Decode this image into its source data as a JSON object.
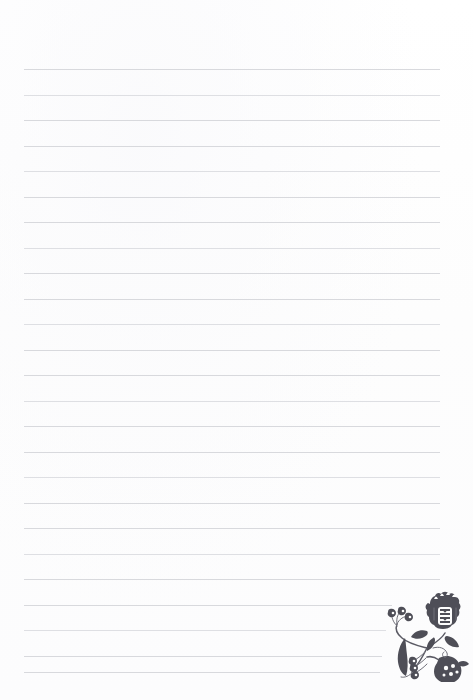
{
  "page": {
    "kind": "lined-writing-paper",
    "width": 473,
    "height": 700,
    "background_color": "#fefefe",
    "text_content": ""
  },
  "ruling": {
    "line_color": "#d6d7db",
    "line_count": 25,
    "first_line_y": 69,
    "line_spacing": 25.5,
    "left_margin_x": 24,
    "right_margin_x": 440,
    "lines": [
      {
        "y": 69,
        "x1": 24,
        "x2": 440
      },
      {
        "y": 95,
        "x1": 24,
        "x2": 440
      },
      {
        "y": 120,
        "x1": 24,
        "x2": 440
      },
      {
        "y": 146,
        "x1": 24,
        "x2": 440
      },
      {
        "y": 171,
        "x1": 24,
        "x2": 440
      },
      {
        "y": 197,
        "x1": 24,
        "x2": 440
      },
      {
        "y": 222,
        "x1": 24,
        "x2": 440
      },
      {
        "y": 248,
        "x1": 24,
        "x2": 440
      },
      {
        "y": 273,
        "x1": 24,
        "x2": 440
      },
      {
        "y": 299,
        "x1": 24,
        "x2": 440
      },
      {
        "y": 324,
        "x1": 24,
        "x2": 440
      },
      {
        "y": 350,
        "x1": 24,
        "x2": 440
      },
      {
        "y": 375,
        "x1": 24,
        "x2": 440
      },
      {
        "y": 401,
        "x1": 24,
        "x2": 440
      },
      {
        "y": 426,
        "x1": 24,
        "x2": 440
      },
      {
        "y": 452,
        "x1": 24,
        "x2": 440
      },
      {
        "y": 477,
        "x1": 24,
        "x2": 440
      },
      {
        "y": 503,
        "x1": 24,
        "x2": 440
      },
      {
        "y": 528,
        "x1": 24,
        "x2": 440
      },
      {
        "y": 554,
        "x1": 24,
        "x2": 440
      },
      {
        "y": 579,
        "x1": 24,
        "x2": 440
      },
      {
        "y": 605,
        "x1": 24,
        "x2": 392
      },
      {
        "y": 630,
        "x1": 24,
        "x2": 386
      },
      {
        "y": 656,
        "x1": 24,
        "x2": 382
      },
      {
        "y": 672,
        "x1": 24,
        "x2": 380
      }
    ]
  },
  "ornament": {
    "name": "folk-art-tulip-floral-motif",
    "description": "Hungarian folk-art style tulip and pomegranate spray with leaves and berry buds",
    "ink_color": "#4e4e57",
    "position": {
      "x": 385,
      "y": 588,
      "width": 88,
      "height": 96
    }
  }
}
